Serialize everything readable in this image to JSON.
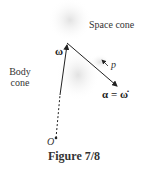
{
  "labels": {
    "space_cone": "Space cone",
    "body_cone_1": "Body",
    "body_cone_2": "cone",
    "omega": "ω",
    "p": "p",
    "alpha_eq": "α = ω̇",
    "origin": "O"
  },
  "caption": "Figure 7/8",
  "colors": {
    "line": "#222222",
    "shading": "#d8d8d8"
  }
}
